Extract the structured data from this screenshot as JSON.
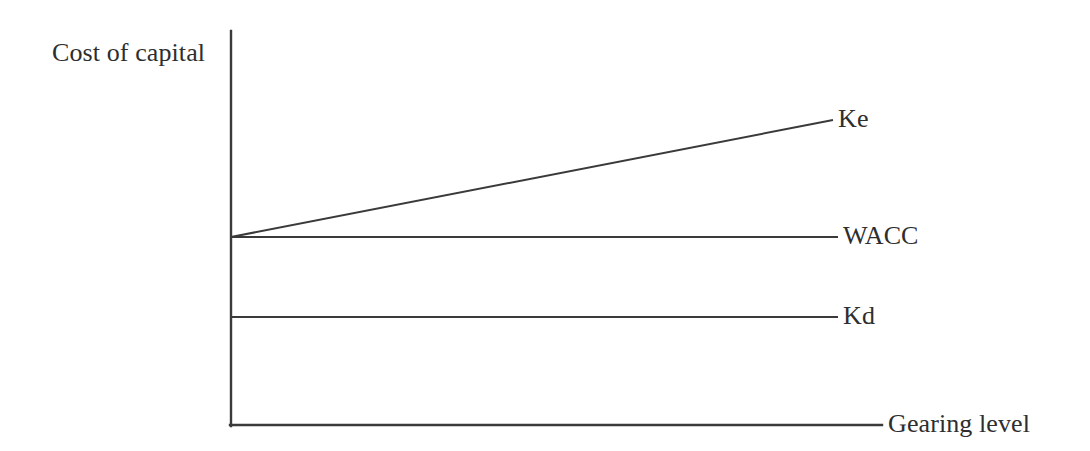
{
  "figure": {
    "name": "cost-of-capital-vs-gearing-level",
    "background_color": "#ffffff",
    "line_color": "#3a3a3a",
    "text_color": "#2e2e2e",
    "width": 1090,
    "height": 451
  },
  "axes": {
    "y_axis_label": "Cost of capital",
    "x_axis_label": "Gearing level"
  },
  "series_labels": {
    "ke": "Ke",
    "wacc": "WACC",
    "kd": "Kd"
  },
  "chart_data": {
    "type": "line",
    "title": "",
    "subtitle": "",
    "xlabel": "Gearing level",
    "ylabel": "Cost of capital",
    "xlim": [
      0,
      1
    ],
    "ylim": [
      0,
      1
    ],
    "grid": false,
    "legend": "inline-right-end-labels",
    "axis_ticks": {
      "x": [],
      "y": []
    },
    "series": [
      {
        "name": "Ke",
        "label": "Ke",
        "style": "solid",
        "color": "#3a3a3a",
        "description": "Cost of equity rises linearly as gearing increases",
        "x": [
          0,
          1
        ],
        "y": [
          0.477,
          0.774
        ]
      },
      {
        "name": "WACC",
        "label": "WACC",
        "style": "solid",
        "color": "#3a3a3a",
        "description": "Weighted average cost of capital stays constant across gearing levels",
        "x": [
          0,
          1
        ],
        "y": [
          0.477,
          0.477
        ]
      },
      {
        "name": "Kd",
        "label": "Kd",
        "style": "solid",
        "color": "#3a3a3a",
        "description": "Cost of debt stays constant across gearing levels",
        "x": [
          0,
          1
        ],
        "y": [
          0.274,
          0.274
        ]
      }
    ],
    "annotations": [
      {
        "text": "Ke",
        "x": 1.0,
        "y": 0.774
      },
      {
        "text": "WACC",
        "x": 1.0,
        "y": 0.477
      },
      {
        "text": "Kd",
        "x": 1.0,
        "y": 0.274
      }
    ]
  },
  "geometry": {
    "y_axis": {
      "x": 231,
      "y_top": 31,
      "y_bottom": 426
    },
    "x_axis": {
      "y": 425,
      "x_left": 230,
      "x_right": 882
    },
    "ke_line": {
      "x1": 231,
      "y1": 237,
      "x2": 833,
      "y2": 120
    },
    "wacc_line": {
      "x1": 231,
      "y1": 237,
      "x2": 838,
      "y2": 237
    },
    "kd_line": {
      "x1": 231,
      "y1": 317,
      "x2": 838,
      "y2": 317
    }
  }
}
